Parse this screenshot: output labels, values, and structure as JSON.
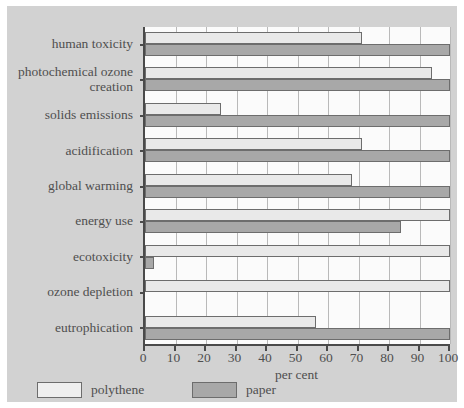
{
  "chart_data": {
    "type": "bar",
    "orientation": "horizontal",
    "title": "",
    "xlabel": "per cent",
    "ylabel": "",
    "xlim": [
      0,
      100
    ],
    "xticks": [
      0,
      10,
      20,
      30,
      40,
      50,
      60,
      70,
      80,
      90,
      100
    ],
    "grid": true,
    "grid_axis": "x",
    "legend_position": "bottom-left",
    "categories": [
      "human toxicity",
      "photochemical ozone\ncreation",
      "solids emissions",
      "acidification",
      "global warming",
      "energy use",
      "ecotoxicity",
      "ozone depletion",
      "eutrophication"
    ],
    "series": [
      {
        "name": "polythene",
        "color": "#e9e9e9",
        "values": [
          71,
          94,
          25,
          71,
          68,
          100,
          100,
          100,
          56
        ]
      },
      {
        "name": "paper",
        "color": "#a8a8a8",
        "values": [
          100,
          100,
          100,
          100,
          100,
          84,
          3,
          0,
          100
        ]
      }
    ]
  },
  "axis": {
    "x_title": "per cent",
    "tick_labels": [
      "0",
      "10",
      "20",
      "30",
      "40",
      "50",
      "60",
      "70",
      "80",
      "90",
      "100"
    ]
  },
  "legend": {
    "items": [
      {
        "label": "polythene",
        "swatch": "light-swatch"
      },
      {
        "label": "paper",
        "swatch": "dark-swatch"
      }
    ]
  },
  "colors": {
    "card_background": "#d2d2d2",
    "plot_background": "#fbfbfb",
    "axis": "#4a4a4a",
    "gridline": "#b9b9b9",
    "polythene": "#e9e9e9",
    "paper": "#a8a8a8",
    "text": "#4f4f4f"
  }
}
